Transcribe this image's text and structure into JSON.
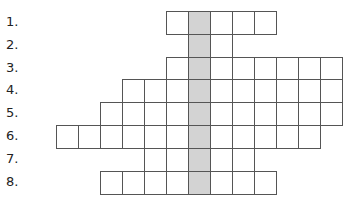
{
  "puzzle": {
    "type": "crossword",
    "clue_numbers": [
      "1.",
      "2.",
      "3.",
      "4.",
      "5.",
      "6.",
      "7.",
      "8."
    ],
    "grid": {
      "cell_width": 22,
      "cell_height": 22.8,
      "origin_x": 56,
      "origin_y": 11,
      "shaded_column_x": 188,
      "shaded_color": "#d3d3d3",
      "border_color": "#555555",
      "rows": [
        {
          "number": "1.",
          "start_col": 5,
          "length": 5
        },
        {
          "number": "2.",
          "start_col": 6,
          "length": 2
        },
        {
          "number": "3.",
          "start_col": 5,
          "length": 8
        },
        {
          "number": "4.",
          "start_col": 3,
          "length": 10
        },
        {
          "number": "5.",
          "start_col": 2,
          "length": 11
        },
        {
          "number": "6.",
          "start_col": 0,
          "length": 12
        },
        {
          "number": "7.",
          "start_col": 4,
          "length": 5
        },
        {
          "number": "8.",
          "start_col": 2,
          "length": 8
        }
      ],
      "shaded_col_index": 6
    }
  }
}
